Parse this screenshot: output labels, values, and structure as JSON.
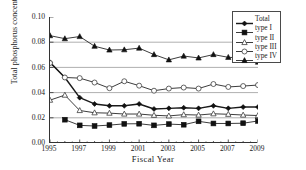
{
  "chart_data": {
    "type": "line",
    "title": "",
    "xlabel": "Fiscal Year",
    "ylabel": "Total phosphorus concentration (mg/L)",
    "x": [
      1995,
      1996,
      1997,
      1998,
      1999,
      2000,
      2001,
      2002,
      2003,
      2004,
      2005,
      2006,
      2007,
      2008,
      2009
    ],
    "xlim": [
      1995,
      2009
    ],
    "ylim": [
      0.0,
      0.1
    ],
    "yticks": [
      "0.00",
      "0.02",
      "0.04",
      "0.06",
      "0.08",
      "0.10"
    ],
    "ytick_values": [
      0.0,
      0.02,
      0.04,
      0.06,
      0.08,
      0.1
    ],
    "xticks": [
      "1995",
      "1997",
      "1999",
      "2001",
      "2003",
      "2005",
      "2007",
      "2009"
    ],
    "xtick_values": [
      1995,
      1997,
      1999,
      2001,
      2003,
      2005,
      2007,
      2009
    ],
    "grid": "horizontal",
    "legend_position": "top-right",
    "series": [
      {
        "name": "Total",
        "marker": "filled-diamond",
        "values": [
          0.064,
          0.052,
          0.036,
          0.031,
          0.0295,
          0.0295,
          0.031,
          0.027,
          0.0275,
          0.028,
          0.0275,
          0.0295,
          0.0275,
          0.0285,
          0.0285
        ]
      },
      {
        "name": "type I",
        "marker": "filled-square",
        "values": [
          null,
          0.0185,
          0.014,
          0.0135,
          0.0142,
          0.0152,
          0.0153,
          0.014,
          0.015,
          0.0145,
          0.0172,
          0.0155,
          0.0155,
          0.0157,
          0.0175
        ]
      },
      {
        "name": "type II",
        "marker": "open-triangle",
        "values": [
          0.034,
          0.038,
          0.0258,
          0.024,
          0.0237,
          0.023,
          0.023,
          0.022,
          0.0215,
          0.0225,
          0.0222,
          0.0232,
          0.0228,
          0.0222,
          0.0218
        ]
      },
      {
        "name": "type III",
        "marker": "open-circle",
        "values": [
          0.0635,
          0.052,
          0.0515,
          0.048,
          0.0435,
          0.049,
          0.0455,
          0.0415,
          0.0432,
          0.044,
          0.0432,
          0.0468,
          0.0445,
          0.0452,
          0.046
        ]
      },
      {
        "name": "type IV",
        "marker": "filled-triangle",
        "values": [
          0.0852,
          0.0828,
          0.0845,
          0.0768,
          0.0738,
          0.074,
          0.0753,
          0.0702,
          0.066,
          0.069,
          0.0675,
          0.0702,
          0.068,
          0.0675,
          0.0642
        ]
      }
    ]
  },
  "legend": {
    "items": [
      {
        "label": "Total"
      },
      {
        "label": "type I"
      },
      {
        "label": "type II"
      },
      {
        "label": "type III"
      },
      {
        "label": "type IV"
      }
    ]
  },
  "colors": {
    "line": "#1a1a1a",
    "grid": "#9a9a9a",
    "axis": "#333333",
    "background": "#ffffff"
  }
}
